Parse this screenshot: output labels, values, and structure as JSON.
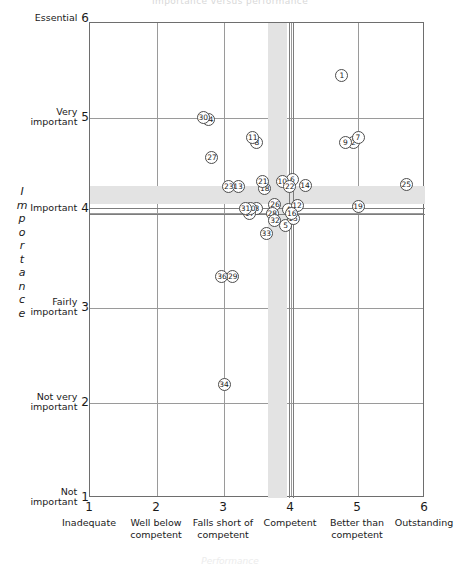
{
  "chart": {
    "title": "Importance versus performance",
    "xlabel": "Performance",
    "ylabel": "Importance"
  },
  "chart_data": {
    "type": "scatter",
    "title": "Importance versus performance",
    "xlabel": "Performance",
    "ylabel": "Importance",
    "xlim": [
      1,
      6
    ],
    "ylim": [
      1,
      6
    ],
    "grid": true,
    "legend": "none",
    "xticks": [
      1,
      2,
      3,
      4,
      5,
      6
    ],
    "yticks": [
      1,
      2,
      3,
      4,
      5,
      6
    ],
    "xticklabels": [
      "Inadequate",
      "Well below competent",
      "Falls short of competent",
      "Competent",
      "Better than competent",
      "Outstanding"
    ],
    "yticklabels": [
      "Not important",
      "Not very important",
      "Fairly important",
      "Important",
      "Very important",
      "Essential"
    ],
    "annotations": {
      "vertical_band": {
        "from": 3.66,
        "to": 3.94,
        "lines": [
          3.97,
          4.03
        ]
      },
      "horizontal_band": {
        "from": 4.09,
        "to": 4.28,
        "lines": [
          4.05,
          3.99
        ]
      }
    },
    "points": [
      {
        "label": "1",
        "x": 4.76,
        "y": 5.45
      },
      {
        "label": "2",
        "x": 4.93,
        "y": 4.74
      },
      {
        "label": "3",
        "x": 3.49,
        "y": 4.05
      },
      {
        "label": "4",
        "x": 3.96,
        "y": 4.04
      },
      {
        "label": "5",
        "x": 3.92,
        "y": 3.87
      },
      {
        "label": "6",
        "x": 4.02,
        "y": 4.35
      },
      {
        "label": "7",
        "x": 5.0,
        "y": 4.79
      },
      {
        "label": "8",
        "x": 3.49,
        "y": 4.74
      },
      {
        "label": "9",
        "x": 4.81,
        "y": 4.74
      },
      {
        "label": "10",
        "x": 3.87,
        "y": 4.33
      },
      {
        "label": "11",
        "x": 3.43,
        "y": 4.79
      },
      {
        "label": "12",
        "x": 4.09,
        "y": 4.08
      },
      {
        "label": "13",
        "x": 3.21,
        "y": 4.28
      },
      {
        "label": "14",
        "x": 4.21,
        "y": 4.29
      },
      {
        "label": "15",
        "x": 4.03,
        "y": 3.94
      },
      {
        "label": "16",
        "x": 4.01,
        "y": 3.99
      },
      {
        "label": "17",
        "x": 3.38,
        "y": 3.99
      },
      {
        "label": "18",
        "x": 3.61,
        "y": 4.26
      },
      {
        "label": "19",
        "x": 5.0,
        "y": 4.07
      },
      {
        "label": "20",
        "x": 3.4,
        "y": 4.05
      },
      {
        "label": "21",
        "x": 3.58,
        "y": 4.33
      },
      {
        "label": "22",
        "x": 3.98,
        "y": 4.28
      },
      {
        "label": "23",
        "x": 3.07,
        "y": 4.28
      },
      {
        "label": "24",
        "x": 2.77,
        "y": 4.98
      },
      {
        "label": "25",
        "x": 5.72,
        "y": 4.3
      },
      {
        "label": "26",
        "x": 3.76,
        "y": 4.09
      },
      {
        "label": "27",
        "x": 2.82,
        "y": 4.58
      },
      {
        "label": "28",
        "x": 3.72,
        "y": 3.99
      },
      {
        "label": "29",
        "x": 3.13,
        "y": 3.33
      },
      {
        "label": "30",
        "x": 2.69,
        "y": 5.01
      },
      {
        "label": "31",
        "x": 3.32,
        "y": 4.05
      },
      {
        "label": "32",
        "x": 3.76,
        "y": 3.92
      },
      {
        "label": "33",
        "x": 3.63,
        "y": 3.78
      },
      {
        "label": "34",
        "x": 3.0,
        "y": 2.2
      },
      {
        "label": "36",
        "x": 2.97,
        "y": 3.33
      }
    ]
  }
}
